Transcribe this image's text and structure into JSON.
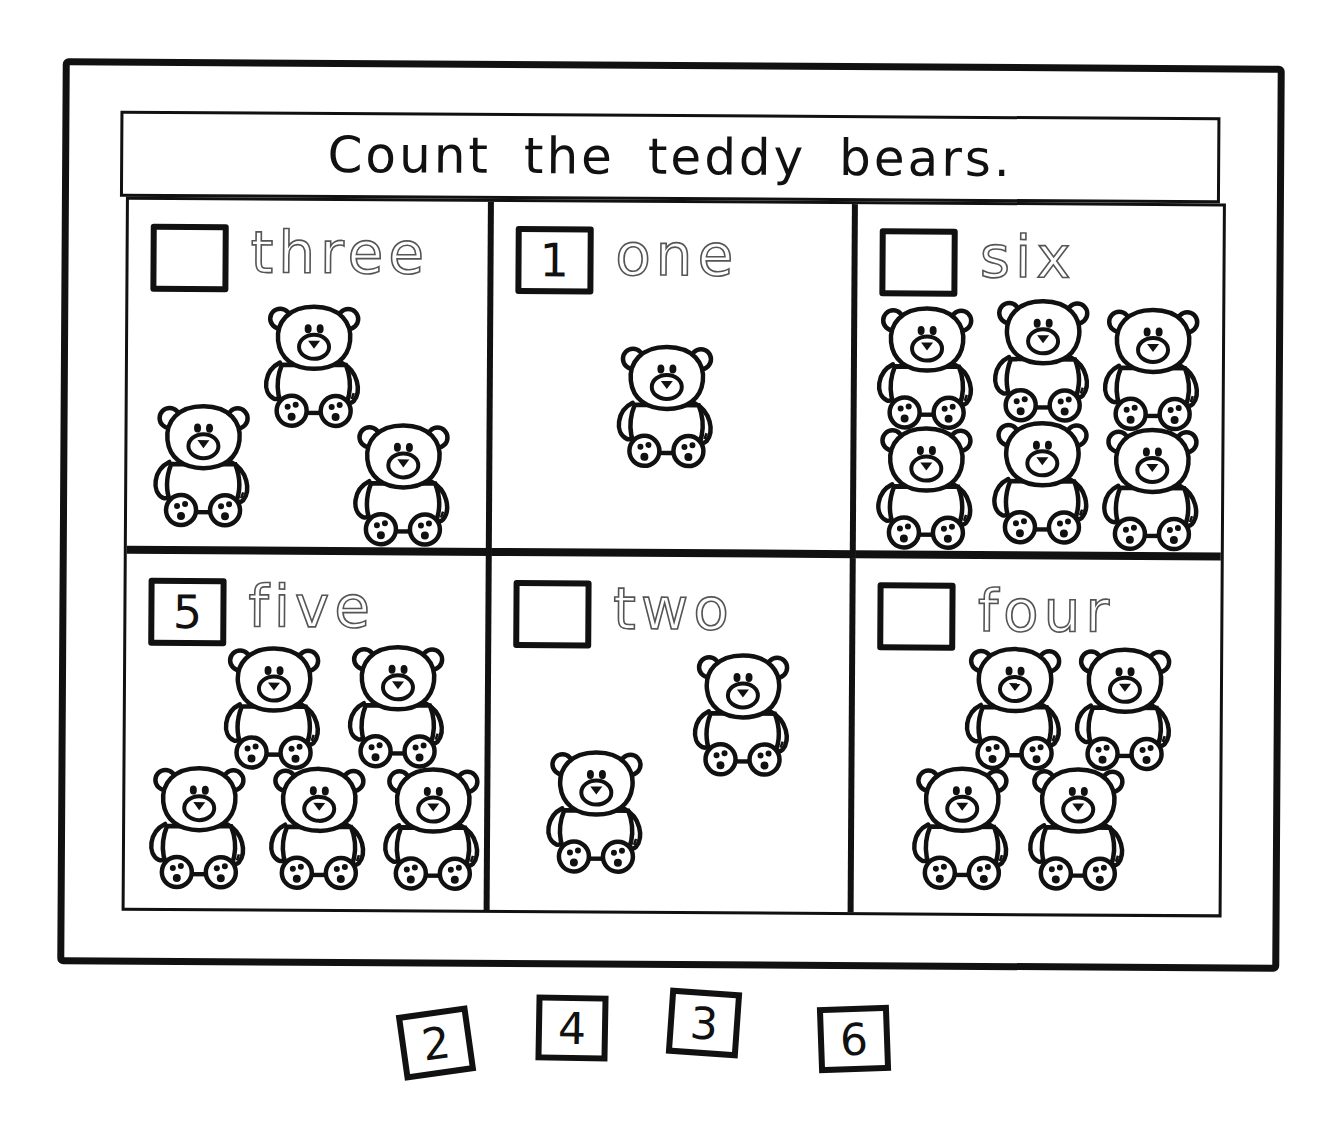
{
  "worksheet": {
    "title": "Count the teddy bears.",
    "cells": [
      {
        "word": "three",
        "answer": "",
        "bear_count": 3
      },
      {
        "word": "one",
        "answer": "1",
        "bear_count": 1
      },
      {
        "word": "six",
        "answer": "",
        "bear_count": 6
      },
      {
        "word": "five",
        "answer": "5",
        "bear_count": 5
      },
      {
        "word": "two",
        "answer": "",
        "bear_count": 2
      },
      {
        "word": "four",
        "answer": "",
        "bear_count": 4
      }
    ],
    "cutout_tiles": [
      "2",
      "4",
      "3",
      "6"
    ],
    "icons": {
      "bear": "teddy-bear-icon",
      "answer_box": "square-outline"
    },
    "colors": {
      "ink": "#111111",
      "tracing": "#555555",
      "paper": "#ffffff"
    }
  }
}
